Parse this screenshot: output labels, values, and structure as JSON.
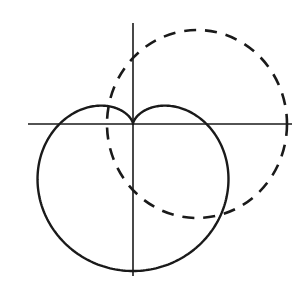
{
  "diagram": {
    "type": "polar-curves",
    "colors": {
      "background": "#ffffff",
      "stroke": "#1a1a1a"
    },
    "axes": {
      "origin": [
        133,
        124
      ],
      "horizontal": {
        "x1": 28,
        "x2": 292,
        "y": 124
      },
      "vertical": {
        "x": 133,
        "y1": 23,
        "y2": 276
      }
    },
    "curves": [
      {
        "name": "cardioid",
        "style": "solid",
        "equation": "r = a(1 - sin θ)",
        "a": 73.5
      },
      {
        "name": "dashed-circle",
        "style": "dashed",
        "center": [
          197,
          124
        ],
        "rx": 90,
        "ry": 94
      }
    ]
  }
}
